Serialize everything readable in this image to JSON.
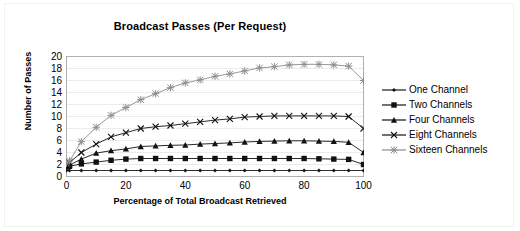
{
  "chart_data": {
    "type": "line",
    "title": "Broadcast Passes (Per Request)",
    "xlabel": "Percentage of Total Broadcast Retrieved",
    "ylabel": "Number of Passes",
    "xlim": [
      0,
      100
    ],
    "ylim": [
      0,
      20
    ],
    "xticks": [
      0,
      20,
      40,
      60,
      80,
      100
    ],
    "yticks": [
      0,
      2,
      4,
      6,
      8,
      10,
      12,
      14,
      16,
      18,
      20
    ],
    "grid": true,
    "legend_position": "right",
    "x": [
      0,
      1,
      5,
      10,
      15,
      20,
      25,
      30,
      35,
      40,
      45,
      50,
      55,
      60,
      65,
      70,
      75,
      80,
      85,
      90,
      95,
      100
    ],
    "series": [
      {
        "name": "One Channel",
        "marker": "diamond",
        "color": "#1a1a1a",
        "values": [
          1.0,
          1.0,
          1.0,
          1.0,
          1.0,
          1.0,
          1.0,
          1.0,
          1.0,
          1.0,
          1.0,
          1.0,
          1.0,
          1.0,
          1.0,
          1.0,
          1.0,
          1.0,
          1.0,
          1.0,
          1.0,
          1.0
        ]
      },
      {
        "name": "Two Channels",
        "marker": "square",
        "color": "#111111",
        "values": [
          1.6,
          1.7,
          2.1,
          2.4,
          2.7,
          2.9,
          3.0,
          3.0,
          3.0,
          3.0,
          3.0,
          3.0,
          3.0,
          3.0,
          3.0,
          3.0,
          3.0,
          3.0,
          2.95,
          2.9,
          2.85,
          2.0
        ]
      },
      {
        "name": "Four Channels",
        "marker": "triangle",
        "color": "#111111",
        "values": [
          1.7,
          1.9,
          2.9,
          3.9,
          4.3,
          4.6,
          5.0,
          5.1,
          5.2,
          5.25,
          5.4,
          5.5,
          5.6,
          5.75,
          5.85,
          5.9,
          5.95,
          5.95,
          5.9,
          5.85,
          5.7,
          4.0
        ]
      },
      {
        "name": "Eight Channels",
        "marker": "cross",
        "color": "#111111",
        "values": [
          1.9,
          2.3,
          4.0,
          5.4,
          6.6,
          7.3,
          8.0,
          8.3,
          8.5,
          8.8,
          9.1,
          9.4,
          9.6,
          9.9,
          10.0,
          10.1,
          10.1,
          10.1,
          10.1,
          10.1,
          10.0,
          8.0
        ]
      },
      {
        "name": "Sixteen Channels",
        "marker": "asterisk",
        "color": "#8c8c8c",
        "values": [
          2.2,
          2.6,
          5.8,
          8.2,
          10.2,
          11.5,
          12.8,
          13.8,
          14.8,
          15.6,
          16.1,
          16.7,
          17.1,
          17.6,
          18.1,
          18.3,
          18.6,
          18.7,
          18.7,
          18.6,
          18.4,
          16.0
        ]
      }
    ]
  },
  "legend": {
    "items": [
      {
        "label": "One Channel"
      },
      {
        "label": "Two Channels"
      },
      {
        "label": "Four Channels"
      },
      {
        "label": "Eight Channels"
      },
      {
        "label": "Sixteen Channels"
      }
    ]
  }
}
